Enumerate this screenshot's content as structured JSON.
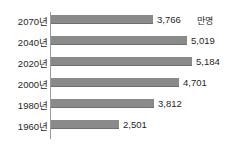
{
  "chart_data": {
    "type": "bar",
    "orientation": "horizontal",
    "title": "",
    "xlabel": "",
    "ylabel": "",
    "unit_label": "만명",
    "grid": false,
    "legend": false,
    "xlim": [
      0,
      5600
    ],
    "categories": [
      "2070년",
      "2040년",
      "2020년",
      "2000년",
      "1980년",
      "1960년"
    ],
    "values": [
      3766,
      5019,
      5184,
      4701,
      3812,
      2501
    ],
    "value_labels": [
      "3,766",
      "5,019",
      "5,184",
      "4,701",
      "3,812",
      "2,501"
    ],
    "bar_color": "#8a8a8a",
    "axis_color": "#9a9a9a",
    "background": "#ffffff"
  },
  "rows": [
    {
      "category": "2070년",
      "value": 3766,
      "value_label": "3,766"
    },
    {
      "category": "2040년",
      "value": 5019,
      "value_label": "5,019"
    },
    {
      "category": "2020년",
      "value": 5184,
      "value_label": "5,184"
    },
    {
      "category": "2000년",
      "value": 4701,
      "value_label": "4,701"
    },
    {
      "category": "1980년",
      "value": 3812,
      "value_label": "3,812"
    },
    {
      "category": "1960년",
      "value": 2501,
      "value_label": "2,501"
    }
  ]
}
